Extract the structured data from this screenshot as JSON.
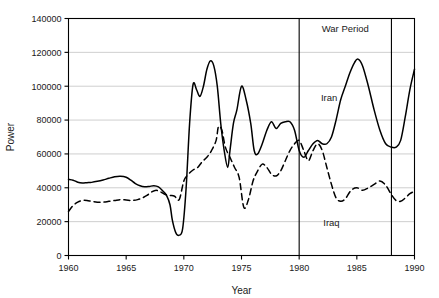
{
  "chart_data": {
    "type": "line",
    "title": "",
    "xlabel": "Year",
    "ylabel": "Power",
    "xlim": [
      1960,
      1990
    ],
    "ylim": [
      0,
      140000
    ],
    "xticks": [
      1960,
      1965,
      1970,
      1975,
      1980,
      1985,
      1990
    ],
    "xtick_labels": [
      "1960",
      "1965",
      "1970",
      "1975",
      "1980",
      "1985",
      "1990"
    ],
    "yticks": [
      0,
      20000,
      40000,
      60000,
      80000,
      100000,
      120000,
      140000
    ],
    "ytick_labels": [
      "0",
      "20000",
      "40000",
      "60000",
      "80000",
      "100000",
      "120000",
      "140000"
    ],
    "grid": "horizontal",
    "legend": "inline-annotations",
    "line_color": "#000000",
    "grid_color": "#b9b9b9",
    "axis_color": "#000000",
    "annotations": [
      {
        "name": "war-period",
        "text": "War Period",
        "x": 1984.0,
        "y": 134000
      },
      {
        "name": "iran-label",
        "text": "Iran",
        "x": 1982.6,
        "y": 93500
      },
      {
        "name": "iraq-label",
        "text": "Iraq",
        "x": 1982.8,
        "y": 19500
      }
    ],
    "vlines": [
      {
        "name": "war-start",
        "x": 1980
      },
      {
        "name": "war-end",
        "x": 1988
      }
    ],
    "series": [
      {
        "name": "Iran",
        "style": "solid",
        "x": [
          1960.0,
          1960.4,
          1960.8,
          1961.2,
          1961.6,
          1962.0,
          1962.5,
          1963.0,
          1963.5,
          1964.0,
          1964.5,
          1965.0,
          1965.4,
          1965.8,
          1966.2,
          1966.6,
          1967.0,
          1967.4,
          1967.8,
          1968.2,
          1968.5,
          1968.8,
          1969.0,
          1969.3,
          1969.6,
          1969.9,
          1970.2,
          1970.5,
          1970.8,
          1971.1,
          1971.4,
          1971.7,
          1972.0,
          1972.3,
          1972.6,
          1972.9,
          1973.2,
          1973.5,
          1973.8,
          1974.0,
          1974.3,
          1974.6,
          1975.0,
          1975.4,
          1975.8,
          1976.1,
          1976.4,
          1976.8,
          1977.2,
          1977.6,
          1978.0,
          1978.4,
          1978.8,
          1979.2,
          1979.6,
          1980.0,
          1980.4,
          1980.8,
          1981.2,
          1981.6,
          1982.0,
          1982.4,
          1982.8,
          1983.2,
          1983.6,
          1984.0,
          1984.4,
          1984.8,
          1985.1,
          1985.5,
          1986.0,
          1986.5,
          1987.0,
          1987.5,
          1988.0,
          1988.4,
          1988.8,
          1989.2,
          1989.6,
          1990.0
        ],
        "y": [
          45000,
          44500,
          43300,
          42800,
          43000,
          43200,
          43800,
          44600,
          45600,
          46500,
          46800,
          46200,
          44500,
          42500,
          41200,
          40600,
          40800,
          41200,
          40500,
          38000,
          35500,
          30000,
          21000,
          13500,
          12000,
          16000,
          40000,
          78000,
          101000,
          98000,
          94000,
          100000,
          110000,
          115000,
          112000,
          100000,
          78000,
          62000,
          52000,
          62000,
          78000,
          86000,
          100000,
          92000,
          78000,
          62000,
          60000,
          66000,
          74000,
          79000,
          75000,
          78000,
          79000,
          79000,
          74000,
          62000,
          58000,
          62000,
          66000,
          68000,
          66000,
          66000,
          70000,
          80000,
          92000,
          100000,
          108000,
          114000,
          116000,
          112000,
          100000,
          86000,
          74000,
          66000,
          64000,
          64000,
          68000,
          82000,
          98000,
          110000
        ]
      },
      {
        "name": "Iraq",
        "style": "dashed",
        "x": [
          1960.0,
          1960.4,
          1960.8,
          1961.2,
          1961.6,
          1962.0,
          1962.5,
          1963.0,
          1963.5,
          1964.0,
          1964.5,
          1965.0,
          1965.5,
          1966.0,
          1966.4,
          1966.8,
          1967.2,
          1967.6,
          1968.0,
          1968.4,
          1968.8,
          1969.2,
          1969.6,
          1970.0,
          1970.4,
          1970.8,
          1971.2,
          1971.6,
          1972.0,
          1972.4,
          1972.8,
          1973.0,
          1973.3,
          1973.6,
          1974.0,
          1974.4,
          1974.8,
          1975.2,
          1975.6,
          1976.0,
          1976.4,
          1976.8,
          1977.2,
          1977.6,
          1978.0,
          1978.4,
          1978.8,
          1979.2,
          1979.6,
          1980.0,
          1980.4,
          1980.8,
          1981.2,
          1981.6,
          1982.0,
          1982.4,
          1982.8,
          1983.2,
          1983.6,
          1984.0,
          1984.5,
          1985.0,
          1985.5,
          1986.0,
          1986.5,
          1987.0,
          1987.5,
          1988.0,
          1988.4,
          1988.8,
          1989.2,
          1989.6,
          1990.0
        ],
        "y": [
          26000,
          29500,
          31500,
          32500,
          32500,
          32000,
          31500,
          31500,
          32000,
          32500,
          33000,
          32800,
          32500,
          33000,
          34000,
          35500,
          37500,
          38500,
          37500,
          36000,
          35500,
          35000,
          33000,
          44000,
          48000,
          50500,
          52000,
          55500,
          58000,
          62000,
          68000,
          76000,
          74000,
          64000,
          58000,
          52000,
          46000,
          28500,
          33000,
          44000,
          50000,
          54000,
          52000,
          48000,
          47000,
          50000,
          56000,
          62000,
          66000,
          68000,
          62000,
          56000,
          62000,
          66000,
          62000,
          52000,
          42000,
          34000,
          32000,
          33500,
          38500,
          40000,
          38500,
          40000,
          42000,
          44000,
          41500,
          36000,
          32500,
          32000,
          34000,
          36500,
          38000
        ]
      }
    ]
  }
}
